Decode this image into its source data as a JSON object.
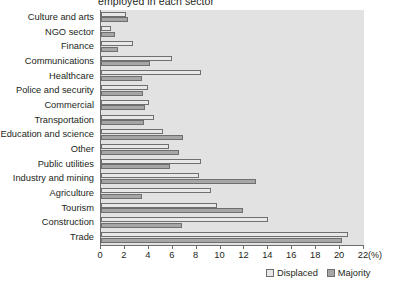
{
  "chart_data": {
    "type": "bar",
    "orientation": "horizontal",
    "title": "employed in each sector",
    "xlabel": "(%)",
    "ylabel": "",
    "xlim": [
      0,
      22
    ],
    "xticks": [
      0,
      2,
      4,
      6,
      8,
      10,
      12,
      14,
      16,
      18,
      20,
      22
    ],
    "grid": false,
    "legend_position": "bottom-right",
    "categories": [
      "Culture and arts",
      "NGO sector",
      "Finance",
      "Communications",
      "Healthcare",
      "Police and security",
      "Commercial",
      "Transportation",
      "Education and science",
      "Other",
      "Public utilities",
      "Industry and mining",
      "Agriculture",
      "Tourism",
      "Construction",
      "Trade"
    ],
    "series": [
      {
        "name": "Displaced",
        "color": "#e8e8e8",
        "values": [
          2.1,
          0.8,
          2.7,
          5.9,
          8.4,
          3.9,
          4.0,
          4.4,
          5.2,
          5.7,
          8.4,
          8.2,
          9.2,
          9.7,
          14.0,
          20.7
        ]
      },
      {
        "name": "Majority",
        "color": "#a6a6a6",
        "values": [
          2.3,
          1.2,
          1.4,
          4.1,
          3.4,
          3.5,
          3.7,
          3.6,
          6.9,
          6.5,
          5.8,
          13.0,
          3.4,
          11.9,
          6.8,
          20.2
        ]
      }
    ]
  },
  "legend": {
    "items": [
      {
        "label": "Displaced"
      },
      {
        "label": "Majority"
      }
    ]
  },
  "axis": {
    "unit_label": "(%)"
  }
}
